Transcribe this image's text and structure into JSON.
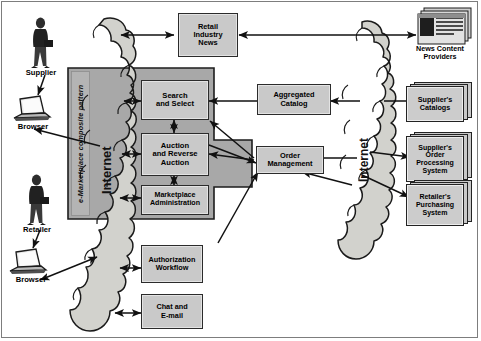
{
  "diagram": {
    "container_label": "e-Marketplace composite pattern",
    "network_label_left": "Internet",
    "network_label_right": "Internet",
    "colors": {
      "box_fill": "#c9c9c9",
      "container_fill": "#a8a8a8",
      "cloud_fill": "#d2d2cd",
      "line": "#111111",
      "border": "#2b2b2b",
      "page_background": "#ffffff"
    },
    "actors": [
      {
        "id": "supplier",
        "label": "Supplier",
        "icon": "person-icon"
      },
      {
        "id": "supplier-browser",
        "label": "Browser",
        "icon": "laptop-icon"
      },
      {
        "id": "retailer",
        "label": "Retailer",
        "icon": "person-icon"
      },
      {
        "id": "retailer-browser",
        "label": "Browser",
        "icon": "laptop-icon"
      }
    ],
    "external_nodes": [
      {
        "id": "retail-industry-news",
        "label": "Retail\nIndustry\nNews",
        "line1": "Retail",
        "line2": "Industry",
        "line3": "News"
      },
      {
        "id": "aggregated-catalog",
        "label": "Aggregated Catalog",
        "line1": "Aggregated",
        "line2": "Catalog"
      },
      {
        "id": "authorization-workflow",
        "label": "Authorization Workflow",
        "line1": "Authorization",
        "line2": "Workflow"
      },
      {
        "id": "chat-and-email",
        "label": "Chat and E-mail",
        "line1": "Chat and",
        "line2": "E-mail"
      }
    ],
    "pattern_nodes": [
      {
        "id": "search-and-select",
        "line1": "Search",
        "line2": "and Select"
      },
      {
        "id": "auction-and-reverse-auction",
        "line1": "Auction",
        "line2": "and Reverse",
        "line3": "Auction"
      },
      {
        "id": "marketplace-administration",
        "line1": "Marketplace",
        "line2": "Administration"
      },
      {
        "id": "order-management",
        "line1": "Order",
        "line2": "Management"
      }
    ],
    "backend_systems": [
      {
        "id": "news-content-providers",
        "line1": "News Content",
        "line2": "Providers",
        "icon": "stacked-newspaper-icon"
      },
      {
        "id": "suppliers-catalogs",
        "line1": "Supplier's",
        "line2": "Catalogs",
        "icon": "stacked-documents-icon"
      },
      {
        "id": "suppliers-order-processing-system",
        "line1": "Supplier's",
        "line2": "Order",
        "line3": "Processing",
        "line4": "System",
        "icon": "stacked-documents-icon"
      },
      {
        "id": "retailers-purchasing-system",
        "line1": "Retailer's",
        "line2": "Purchasing",
        "line3": "System",
        "icon": "stacked-documents-icon"
      }
    ]
  }
}
